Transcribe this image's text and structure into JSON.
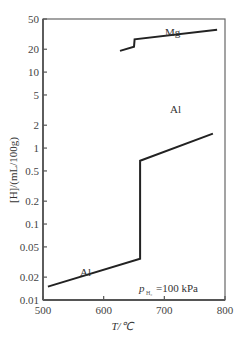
{
  "chart_data": {
    "type": "line",
    "title": "",
    "xlabel": "T/℃",
    "ylabel": "[H]/(mL/100g)",
    "xlim": [
      500,
      800
    ],
    "ylim": [
      0.01,
      50
    ],
    "yscale": "log",
    "grid": false,
    "x_ticks": [
      "500",
      "600",
      "700",
      "800"
    ],
    "y_ticks": [
      "0.01",
      "0.02",
      "0.05",
      "0.1",
      "0.2",
      "0.5",
      "1",
      "2",
      "5",
      "10",
      "20",
      "50"
    ],
    "series": [
      {
        "name": "Al",
        "points": [
          [
            508,
            0.015
          ],
          [
            660,
            0.035
          ],
          [
            660,
            0.68
          ],
          [
            780,
            1.55
          ]
        ]
      },
      {
        "name": "Mg",
        "points": [
          [
            627,
            19
          ],
          [
            650,
            21.5
          ],
          [
            651,
            27
          ],
          [
            787,
            36
          ]
        ]
      }
    ],
    "annotations": [
      {
        "text": "Mg",
        "x": 700,
        "y": 30
      },
      {
        "text": "Al",
        "x": 725,
        "y": 2.3
      },
      {
        "text": "Al",
        "x": 565,
        "y": 0.025
      },
      {
        "text": "p_H2=100 kPa",
        "x": 700,
        "y": 0.014
      }
    ]
  },
  "labels": {
    "xlabel": "T/℃",
    "ylabel": "[H]/(mL/100g)",
    "mg": "Mg",
    "al_upper": "Al",
    "al_lower": "Al",
    "pressure_p": "p",
    "pressure_sub": "H₂",
    "pressure_val": "=100 kPa"
  }
}
